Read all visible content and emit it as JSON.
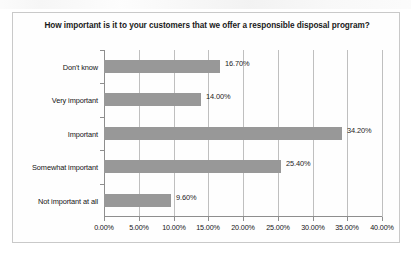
{
  "chart_data": {
    "type": "bar",
    "orientation": "horizontal",
    "title": "How important is it to your customers that we offer a responsible disposal program?",
    "title_line1": "How important is it to your customers that we offer a responsible disposal",
    "title_line2": "program?",
    "xlabel": "",
    "ylabel": "",
    "xlim": [
      0,
      40
    ],
    "grid": true,
    "legend": "none",
    "bar_color": "#989898",
    "gridline_color": "#bfbfbf",
    "axis_color": "#8e8e8e",
    "categories": [
      "Don't know",
      "Very important",
      "Important",
      "Somewhat important",
      "Not important at all"
    ],
    "values": [
      16.7,
      14.0,
      34.2,
      25.4,
      9.6
    ],
    "data_labels": [
      "16.70%",
      "14.00%",
      "34.20%",
      "25.40%",
      "9.60%"
    ],
    "xticks": [
      0,
      5,
      10,
      15,
      20,
      25,
      30,
      35,
      40
    ],
    "xtick_labels": [
      "0.00%",
      "5.00%",
      "10.00%",
      "15.00%",
      "20.00%",
      "25.00%",
      "30.00%",
      "35.00%",
      "40.00%"
    ]
  }
}
